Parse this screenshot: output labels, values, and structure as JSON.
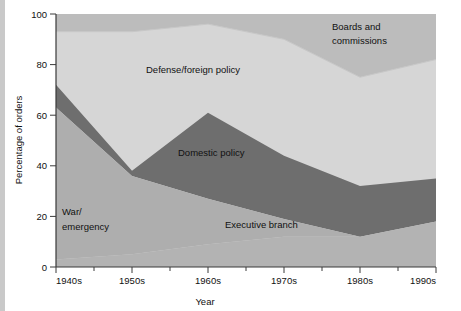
{
  "chart_data": {
    "type": "area",
    "stacked": true,
    "title": "",
    "xlabel": "Year",
    "ylabel": "Percentage of orders",
    "categories": [
      "1940s",
      "1950s",
      "1960s",
      "1970s",
      "1980s",
      "1990s"
    ],
    "x_tick_labels": [
      "1940s",
      "1950s",
      "1960s",
      "1970s",
      "1980s",
      "1990s"
    ],
    "y_tick_labels": [
      "0",
      "20",
      "40",
      "60",
      "80",
      "100"
    ],
    "y_ticks": [
      0,
      20,
      40,
      60,
      80,
      100
    ],
    "ylim": [
      0,
      100
    ],
    "grid": false,
    "legend": "inline-annotations",
    "series": [
      {
        "name": "Executive branch",
        "color": "#b3b3b3",
        "values": [
          3,
          5,
          9,
          12,
          12,
          18
        ]
      },
      {
        "name": "War/emergency",
        "color": "#aeaeae",
        "values": [
          60,
          31,
          18,
          7,
          0,
          0
        ]
      },
      {
        "name": "Domestic policy",
        "color": "#6e6e6e",
        "values": [
          9,
          2,
          34,
          25,
          20,
          17
        ]
      },
      {
        "name": "Defense/foreign policy",
        "color": "#d6d6d6",
        "values": [
          21,
          55,
          35,
          46,
          43,
          47
        ]
      },
      {
        "name": "Boards and commissions",
        "color": "#bcbcbc",
        "values": [
          7,
          7,
          4,
          10,
          25,
          18
        ]
      }
    ],
    "annotations": [
      {
        "text": "Defense/foreign policy",
        "x_px": 146,
        "y_px": 73
      },
      {
        "text": "Boards and",
        "x_px": 332,
        "y_px": 30
      },
      {
        "text": "commissions",
        "x_px": 332,
        "y_px": 44
      },
      {
        "text": "Domestic policy",
        "x_px": 178,
        "y_px": 156
      },
      {
        "text": "War/",
        "x_px": 62,
        "y_px": 215
      },
      {
        "text": "emergency",
        "x_px": 62,
        "y_px": 230
      },
      {
        "text": "Executive branch",
        "x_px": 225,
        "y_px": 228
      }
    ]
  },
  "axes": {
    "y_axis_title": "Percentage of orders",
    "x_axis_title": "Year"
  },
  "colors": {
    "executive_branch": "#b3b3b3",
    "war_emergency": "#aeaeae",
    "domestic_policy": "#6e6e6e",
    "defense_foreign": "#d6d6d6",
    "boards_commissions": "#bcbcbc",
    "background": "#ffffff",
    "axis": "#3a3a3a",
    "text": "#111111",
    "left_margin_strip": "#c9c9c9"
  }
}
